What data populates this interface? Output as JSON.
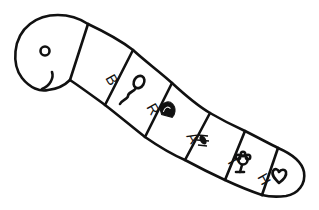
{
  "illustration": {
    "subject": "worm",
    "colors": {
      "ink": "#111111",
      "background": "#ffffff"
    },
    "segments": [
      {
        "letter": "B",
        "icon": "tadpole-icon",
        "letter_pos": [
          108,
          72
        ],
        "rotate": 60
      },
      {
        "letter": "R",
        "icon": "dome-icon",
        "letter_pos": [
          149,
          102
        ],
        "rotate": 60
      },
      {
        "letter": "A",
        "icon": "bug-icon",
        "letter_pos": [
          189,
          131
        ],
        "rotate": 60
      },
      {
        "letter": "T",
        "icon": "flower-icon",
        "letter_pos": [
          229,
          156
        ],
        "rotate": 60
      },
      {
        "letter": "H",
        "icon": "heart-icon",
        "letter_pos": [
          259,
          174
        ],
        "rotate": 60
      }
    ]
  }
}
